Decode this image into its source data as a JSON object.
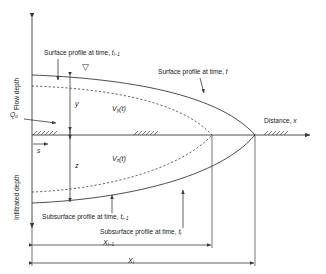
{
  "figure": {
    "axes": {
      "y_axis_upper_label": "Flow depth",
      "y_axis_lower_label": "Infiltrated depth",
      "x_axis_label_text": "Distance, ",
      "x_axis_label_var": "x"
    },
    "inflow": {
      "symbol": "Q",
      "subscript": "o"
    },
    "soil_coordinate": {
      "symbol": "s"
    },
    "water_surface_marker": "▽",
    "annotations": {
      "surface_previous_text": "Surface profile at time, ",
      "surface_previous_var": "t",
      "surface_previous_sub": "i−1",
      "surface_current_text": "Surface profile at time, ",
      "surface_current_var": "t",
      "subsurface_previous_text": "Subsurface profile at time, ",
      "subsurface_previous_var": "t",
      "subsurface_previous_sub": "i−1",
      "subsurface_current_text": "Subsurface profile at time, ",
      "subsurface_current_var": "t",
      "subsurface_current_sub": "i"
    },
    "volumes": {
      "surface_volume": "V",
      "surface_volume_sub": "y",
      "surface_volume_arg": "(t)",
      "subsurface_volume": "V",
      "subsurface_volume_sub": "z",
      "subsurface_volume_arg": "(t)"
    },
    "depths": {
      "flow_depth_symbol": "y",
      "infiltrated_depth_symbol": "z"
    },
    "distances": {
      "advance_previous": "X",
      "advance_previous_sub": "i−1",
      "advance_current": "X",
      "advance_current_sub": "i"
    },
    "colors": {
      "line": "#3a3a3a",
      "text": "#1a1a1a",
      "background": "#ffffff"
    }
  }
}
